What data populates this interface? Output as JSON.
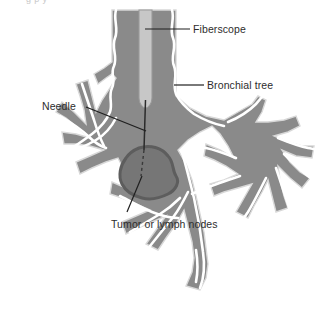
{
  "figure": {
    "title_cut_off": "g p y",
    "type": "medical-illustration",
    "colors": {
      "airway_fill": "#8a8a8a",
      "airway_outline": "#ffffff",
      "airway_edge": "#d6d6d6",
      "fiberscope_fill": "#c7c7c7",
      "fiberscope_edge": "#9a9a9a",
      "tumor_fill": "#767676",
      "tumor_outline": "#5d5d5d",
      "needle": "#2b2b2b",
      "label_text": "#2d2d2d",
      "leader_line": "#1f1f1f",
      "background": "#ffffff"
    },
    "labels": [
      {
        "id": "fiberscope",
        "text": "Fiberscope",
        "leader": {
          "x1": 145,
          "y1": 29,
          "x2": 190,
          "y2": 29
        }
      },
      {
        "id": "bronchial-tree",
        "text": "Bronchial tree",
        "leader": {
          "x1": 174,
          "y1": 85,
          "x2": 204,
          "y2": 85
        }
      },
      {
        "id": "needle",
        "text": "Needle",
        "leader": {
          "x1": 86,
          "y1": 108,
          "x2": 146,
          "y2": 131
        }
      },
      {
        "id": "tumor-or-lymph-nodes",
        "text": "Tumor or lymph nodes",
        "leader": {
          "x1": 127,
          "y1": 212,
          "x2": 141,
          "y2": 177
        }
      }
    ],
    "structures": [
      {
        "name": "trachea",
        "description": "vertical central airway"
      },
      {
        "name": "fiberscope-tube",
        "description": "light tube inside trachea ending in rounded tip"
      },
      {
        "name": "needle",
        "description": "thin line from scope tip into mass, dashed inside mass"
      },
      {
        "name": "tumor-mass",
        "description": "irregular dark blob below carina"
      },
      {
        "name": "left-bronchial-branches",
        "description": "branching airways to the left"
      },
      {
        "name": "right-bronchial-branches",
        "description": "branching airways to the right"
      }
    ]
  }
}
